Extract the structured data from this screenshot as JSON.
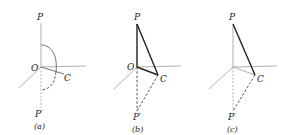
{
  "figure": {
    "panels": [
      {
        "caption": "(a)",
        "labels": {
          "P": "P",
          "O": "O",
          "C": "C",
          "P_prime": "P′"
        },
        "elements": [
          "vertical axis P–O (solid gray)",
          "dashed vertical O–P′",
          "horizontal axis",
          "diagonal axis",
          "line O–C",
          "solid arc P→C",
          "dashed arc C→P′"
        ]
      },
      {
        "caption": "(b)",
        "labels": {
          "P": "P",
          "O": "O",
          "C": "C",
          "P_prime": "P′"
        },
        "elements": [
          "solid triangle P–O–C",
          "dashed O–P′",
          "dashed C–P′",
          "horizontal axis",
          "diagonal axis"
        ]
      },
      {
        "caption": "(c)",
        "labels": {
          "P": "P",
          "C": "C",
          "P_prime": "P′"
        },
        "elements": [
          "solid line P–C",
          "gray vertical axis",
          "gray O–C",
          "dashed gray O–P′",
          "dashed C–P′",
          "horizontal axis",
          "diagonal axis"
        ]
      }
    ]
  }
}
